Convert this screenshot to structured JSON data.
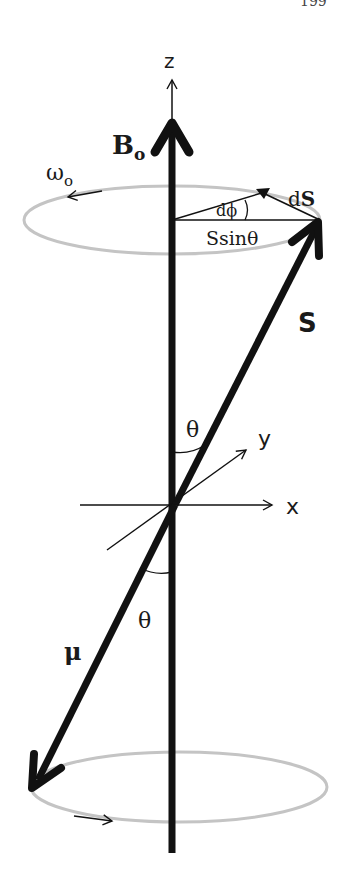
{
  "page": {
    "number": "199"
  },
  "diagram": {
    "axes": {
      "z": "z",
      "x": "x",
      "y": "y"
    },
    "labels": {
      "field": "B",
      "field_sub": "o",
      "angular_velocity": "ω",
      "angular_velocity_sub": "o",
      "spin_vector": "S",
      "change_vector": "dS",
      "change_vector_prefix": "d",
      "change_vector_letter": "S",
      "angle_increment": "dϕ",
      "radius_label": "Ssinθ",
      "angle_upper": "θ",
      "angle_lower": "θ",
      "magnetic_moment": "μ"
    },
    "colors": {
      "ink": "#111111",
      "orbit": "#c4c4c4"
    }
  }
}
